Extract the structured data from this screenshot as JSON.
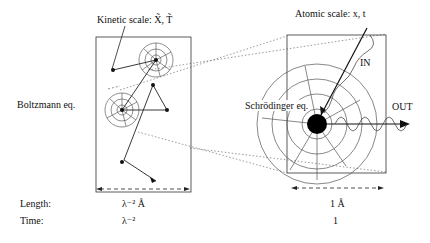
{
  "labels": {
    "kinetic_scale": "Kinetic scale:  X̃, T̃",
    "atomic_scale": "Atomic scale:  x, t",
    "boltzmann": "Boltzmann eq.",
    "schrodinger": "Schrödinger eq.",
    "in": "IN",
    "out": "OUT"
  },
  "table": {
    "rows": [
      {
        "label": "Length:",
        "kinetic": "λ⁻²  Å",
        "atomic": "1  Å"
      },
      {
        "label": "Time:",
        "kinetic": "λ⁻²",
        "atomic": "1"
      }
    ]
  }
}
